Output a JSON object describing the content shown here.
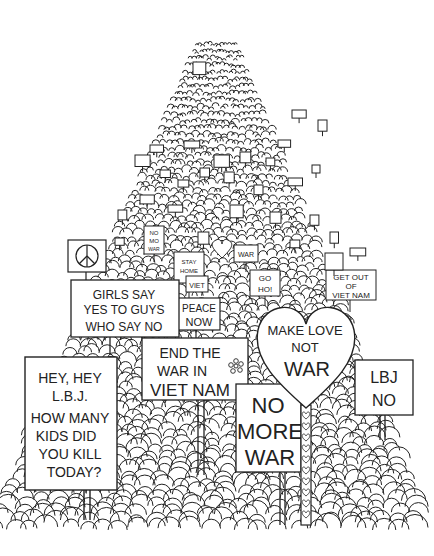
{
  "colors": {
    "ink": "#222222",
    "paper": "#ffffff"
  },
  "signs": {
    "hey_lbj": {
      "lines": [
        "HEY, HEY",
        "L.B.J.",
        "HOW MANY",
        "KIDS DID",
        "YOU KILL",
        "TODAY?"
      ]
    },
    "girls_say": {
      "lines": [
        "GIRLS SAY",
        "YES TO GUYS",
        "WHO SAY NO"
      ]
    },
    "end_the_war": {
      "lines": [
        "END THE",
        "WAR IN",
        "VIET NAM"
      ]
    },
    "make_love": {
      "lines": [
        "MAKE LOVE",
        "NOT",
        "WAR"
      ]
    },
    "no_more_war": {
      "lines": [
        "NO",
        "MORE",
        "WAR"
      ]
    },
    "lbj_no": {
      "lines": [
        "LBJ",
        "NO"
      ]
    },
    "peace_now": {
      "lines": [
        "PEACE",
        "NOW"
      ]
    },
    "get_out": {
      "lines": [
        "GET OUT",
        "OF",
        "VIET NAM"
      ]
    },
    "go_ho": {
      "lines": [
        "GO",
        "HO!"
      ]
    },
    "stay_home": {
      "lines": [
        "STAY",
        "HOME"
      ]
    },
    "viet": {
      "lines": [
        "VIET"
      ]
    },
    "no_mo_war": {
      "lines": [
        "NO",
        "MO",
        "WAR"
      ]
    },
    "war_small": {
      "lines": [
        "WAR"
      ]
    }
  },
  "peace_symbol": "peace-sign"
}
